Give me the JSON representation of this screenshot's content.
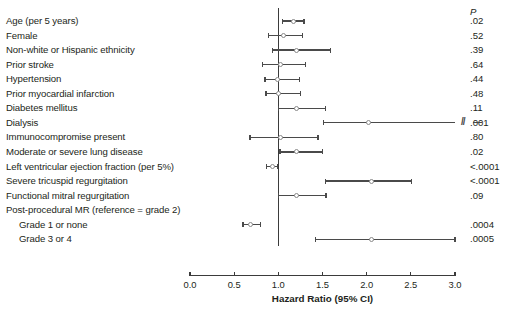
{
  "chart_data": {
    "type": "scatter",
    "subtype": "forest-plot",
    "title": "",
    "xlabel": "Hazard Ratio (95% CI)",
    "ylabel": "",
    "xlim": [
      0.0,
      3.0
    ],
    "xticks": [
      "0.0",
      "0.5",
      "1.0",
      "1.5",
      "2.0",
      "2.5",
      "3.0"
    ],
    "xtick_values": [
      0.0,
      0.5,
      1.0,
      1.5,
      2.0,
      2.5,
      3.0
    ],
    "reference_line": 1.0,
    "grid": false,
    "legend": "none",
    "pvalue_header": "P",
    "categories": [
      "Age (per 5 years)",
      "Female",
      "Non-white or Hispanic ethnicity",
      "Prior stroke",
      "Hypertension",
      "Prior myocardial infarction",
      "Diabetes mellitus",
      "Dialysis",
      "Immunocompromise present",
      "Moderate or severe lung disease",
      "Left ventricular ejection fraction (per 5%)",
      "Severe tricuspid regurgitation",
      "Functional mitral regurgitation",
      "Post-procedural MR (reference = grade 2)",
      "Grade 1 or none",
      "Grade 3 or 4"
    ],
    "rows": [
      {
        "label": "Age (per 5 years)",
        "hr": 1.17,
        "lo": 1.05,
        "hi": 1.29,
        "p": ".02",
        "indent": false,
        "has_data": true,
        "truncated_hi": false
      },
      {
        "label": "Female",
        "hr": 1.06,
        "lo": 0.89,
        "hi": 1.27,
        "p": ".52",
        "indent": false,
        "has_data": true,
        "truncated_hi": false
      },
      {
        "label": "Non-white or Hispanic ethnicity",
        "hr": 1.2,
        "lo": 0.93,
        "hi": 1.59,
        "p": ".39",
        "indent": false,
        "has_data": true,
        "truncated_hi": false
      },
      {
        "label": "Prior stroke",
        "hr": 1.03,
        "lo": 0.82,
        "hi": 1.31,
        "p": ".64",
        "indent": false,
        "has_data": true,
        "truncated_hi": false
      },
      {
        "label": "Hypertension",
        "hr": 0.99,
        "lo": 0.85,
        "hi": 1.24,
        "p": ".44",
        "indent": false,
        "has_data": true,
        "truncated_hi": false
      },
      {
        "label": "Prior myocardial infarction",
        "hr": 1.0,
        "lo": 0.86,
        "hi": 1.25,
        "p": ".48",
        "indent": false,
        "has_data": true,
        "truncated_hi": false
      },
      {
        "label": "Diabetes mellitus",
        "hr": 1.21,
        "lo": 1.0,
        "hi": 1.53,
        "p": ".11",
        "indent": false,
        "has_data": true,
        "truncated_hi": false
      },
      {
        "label": "Dialysis",
        "hr": 2.02,
        "lo": 1.51,
        "hi": 3.0,
        "p": ".001",
        "indent": false,
        "has_data": true,
        "truncated_hi": true
      },
      {
        "label": "Immunocompromise present",
        "hr": 1.03,
        "lo": 0.68,
        "hi": 1.45,
        "p": ".80",
        "indent": false,
        "has_data": true,
        "truncated_hi": false
      },
      {
        "label": "Moderate or severe lung disease",
        "hr": 1.21,
        "lo": 1.02,
        "hi": 1.5,
        "p": ".02",
        "indent": false,
        "has_data": true,
        "truncated_hi": false
      },
      {
        "label": "Left ventricular ejection fraction (per 5%)",
        "hr": 0.93,
        "lo": 0.87,
        "hi": 0.99,
        "p": "<.0001",
        "indent": false,
        "has_data": true,
        "truncated_hi": false
      },
      {
        "label": "Severe tricuspid regurgitation",
        "hr": 2.06,
        "lo": 1.53,
        "hi": 2.51,
        "p": "<.0001",
        "indent": false,
        "has_data": true,
        "truncated_hi": false
      },
      {
        "label": "Functional mitral regurgitation",
        "hr": 1.2,
        "lo": 1.0,
        "hi": 1.54,
        "p": ".09",
        "indent": false,
        "has_data": true,
        "truncated_hi": false
      },
      {
        "label": "Post-procedural MR (reference = grade 2)",
        "hr": null,
        "lo": null,
        "hi": null,
        "p": "",
        "indent": false,
        "has_data": false,
        "truncated_hi": false
      },
      {
        "label": "Grade 1 or none",
        "hr": 0.69,
        "lo": 0.6,
        "hi": 0.8,
        "p": ".0004",
        "indent": true,
        "has_data": true,
        "truncated_hi": false
      },
      {
        "label": "Grade 3 or 4",
        "hr": 2.06,
        "lo": 1.42,
        "hi": 3.0,
        "p": ".0005",
        "indent": true,
        "has_data": true,
        "truncated_hi": false
      }
    ],
    "colors": {
      "line": "#4a4a4a",
      "marker_edge": "#8a8a8a",
      "marker_fill": "#ffffff",
      "reference": "#3b3b3b",
      "axis": "#3b3b3b",
      "text": "#231f20",
      "background": "#ffffff"
    }
  }
}
